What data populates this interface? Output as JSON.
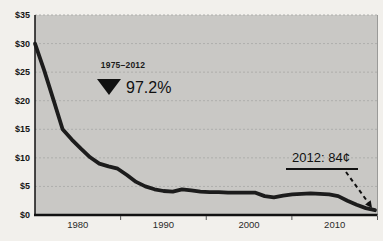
{
  "chart_data": {
    "type": "line",
    "title": "",
    "xlabel": "",
    "ylabel": "",
    "xlim": [
      1975,
      2015
    ],
    "ylim": [
      0,
      35
    ],
    "grid": true,
    "x_tick_labels": [
      "1980",
      "1990",
      "2000",
      "2010"
    ],
    "x_tick_years": [
      1980,
      1990,
      2000,
      2010
    ],
    "x_minor_tick_years": [
      1985,
      1995,
      2005,
      2015
    ],
    "y_tick_labels": [
      "$35",
      "$30",
      "$25",
      "$20",
      "$15",
      "$10",
      "$5",
      "$0"
    ],
    "y_tick_values": [
      35,
      30,
      25,
      20,
      15,
      10,
      5,
      0
    ],
    "series": [
      {
        "name": "price-per-watt",
        "x": [
          1975,
          1976,
          1977,
          1978,
          1979,
          1980,
          1981,
          1982,
          1983,
          1984,
          1985,
          1986,
          1987,
          1988,
          1989,
          1990,
          1991,
          1992,
          1993,
          1994,
          1995,
          1996,
          1997,
          1998,
          1999,
          2000,
          2001,
          2002,
          2003,
          2004,
          2005,
          2006,
          2007,
          2008,
          2009,
          2010,
          2011,
          2012
        ],
        "values": [
          30.0,
          25.3,
          20.2,
          15.0,
          13.2,
          11.6,
          10.1,
          9.0,
          8.5,
          8.1,
          7.0,
          5.8,
          5.0,
          4.5,
          4.2,
          4.1,
          4.5,
          4.3,
          4.1,
          4.0,
          4.0,
          3.9,
          3.9,
          3.9,
          3.9,
          3.3,
          3.1,
          3.4,
          3.6,
          3.7,
          3.8,
          3.7,
          3.6,
          3.3,
          2.5,
          1.8,
          1.2,
          0.84
        ]
      }
    ],
    "annotations": {
      "decline": {
        "period": "1975–2012",
        "value": "97.2%",
        "marker": "down-triangle"
      },
      "endpoint": {
        "label": "2012: 84¢"
      }
    },
    "colors": {
      "page_bg": "#f2f0ec",
      "plot_bg": "#c9c8c5",
      "grid": "#aeaeac",
      "line": "#1c1c1c",
      "axis": "#111111",
      "text": "#1a1a1a"
    },
    "legend": "none"
  }
}
